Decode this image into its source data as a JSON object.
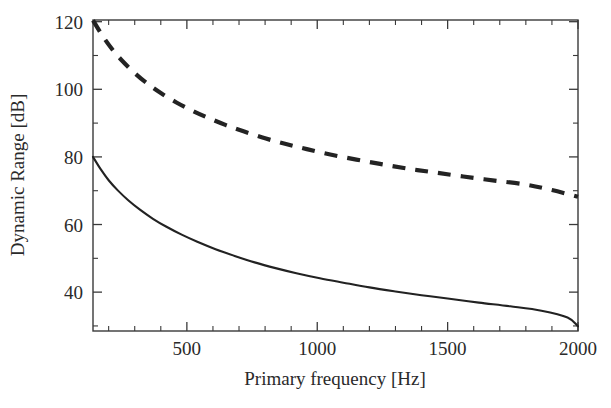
{
  "chart_data": {
    "type": "line",
    "title": "",
    "xlabel": "Primary frequency [Hz]",
    "ylabel": "Dynamic Range [dB]",
    "xlim": [
      140,
      2000
    ],
    "ylim": [
      28.5,
      120.5
    ],
    "grid": false,
    "legend": null,
    "x_ticks": [
      500,
      1000,
      1500,
      2000
    ],
    "x_tick_labels": [
      "500",
      "1000",
      "1500",
      "2000"
    ],
    "x_minor_tick_interval": 100,
    "y_ticks": [
      40,
      60,
      80,
      100,
      120
    ],
    "y_tick_labels": [
      "40",
      "60",
      "80",
      "100",
      "120"
    ],
    "y_minor_tick_interval": 10,
    "series": [
      {
        "name": "upper-dashed-curve",
        "style": "dashed",
        "color": "#232323",
        "x": [
          140,
          175,
          210,
          250,
          300,
          350,
          400,
          460,
          520,
          580,
          650,
          720,
          800,
          880,
          960,
          1050,
          1150,
          1250,
          1350,
          1450,
          1560,
          1680,
          1800,
          1900,
          2000
        ],
        "y": [
          120.4,
          116.0,
          112.2,
          108.6,
          104.8,
          101.6,
          98.9,
          96.1,
          93.7,
          91.6,
          89.4,
          87.5,
          85.5,
          83.8,
          82.3,
          80.7,
          79.2,
          77.8,
          76.5,
          75.4,
          74.2,
          73.0,
          71.8,
          70.2,
          68.2
        ]
      },
      {
        "name": "lower-solid-curve",
        "style": "solid",
        "color": "#222222",
        "x": [
          140,
          170,
          200,
          235,
          275,
          320,
          370,
          420,
          480,
          540,
          610,
          680,
          760,
          840,
          920,
          1010,
          1100,
          1200,
          1300,
          1400,
          1500,
          1620,
          1740,
          1860,
          1960,
          2000
        ],
        "y": [
          80.0,
          76.3,
          73.1,
          70.1,
          67.2,
          64.4,
          61.7,
          59.4,
          57.0,
          54.9,
          52.7,
          50.8,
          48.8,
          47.1,
          45.6,
          44.1,
          42.8,
          41.4,
          40.2,
          39.1,
          38.1,
          36.9,
          35.8,
          34.5,
          32.5,
          29.9
        ]
      }
    ]
  },
  "axes": {
    "ylabel": "Dynamic Range [dB]",
    "xlabel": "Primary frequency [Hz]"
  }
}
